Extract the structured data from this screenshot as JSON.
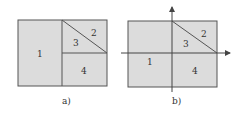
{
  "colors": {
    "fill": "#dcdcdc",
    "stroke": "#555555",
    "background": "#ffffff"
  },
  "diagram_a": {
    "caption": "a)",
    "regions": [
      {
        "label": "1"
      },
      {
        "label": "2"
      },
      {
        "label": "3"
      },
      {
        "label": "4"
      }
    ]
  },
  "diagram_b": {
    "caption": "b)",
    "regions": [
      {
        "label": "1"
      },
      {
        "label": "2"
      },
      {
        "label": "3"
      },
      {
        "label": "4"
      }
    ],
    "axes": [
      "x-axis-arrow",
      "y-axis-arrow"
    ]
  }
}
